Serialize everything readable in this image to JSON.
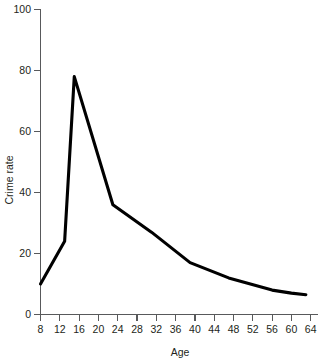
{
  "chart_data": {
    "type": "line",
    "title": "",
    "xlabel": "Age",
    "ylabel": "Crime rate",
    "xlim": [
      8,
      64
    ],
    "ylim": [
      0,
      100
    ],
    "grid": false,
    "legend": null,
    "x_ticks": [
      8,
      12,
      16,
      20,
      24,
      28,
      32,
      36,
      40,
      44,
      48,
      52,
      56,
      60,
      64
    ],
    "x_tick_labels": [
      "8",
      "12",
      "16",
      "20",
      "24",
      "28",
      "32",
      "36",
      "40",
      "44",
      "48",
      "52",
      "56",
      "60",
      "64"
    ],
    "y_ticks": [
      0,
      20,
      40,
      60,
      80,
      100
    ],
    "y_tick_labels": [
      "0",
      "20",
      "40",
      "60",
      "80",
      "100"
    ],
    "series": [
      {
        "name": "Crime rate",
        "color": "#000000",
        "x": [
          8,
          13,
          15,
          23,
          31,
          39,
          47,
          56,
          60,
          63
        ],
        "values": [
          10,
          24,
          78,
          36,
          27,
          17,
          12,
          8,
          7,
          6.5
        ]
      }
    ]
  },
  "axes": {
    "axis_color": "#58595b",
    "line_color": "#000000"
  }
}
